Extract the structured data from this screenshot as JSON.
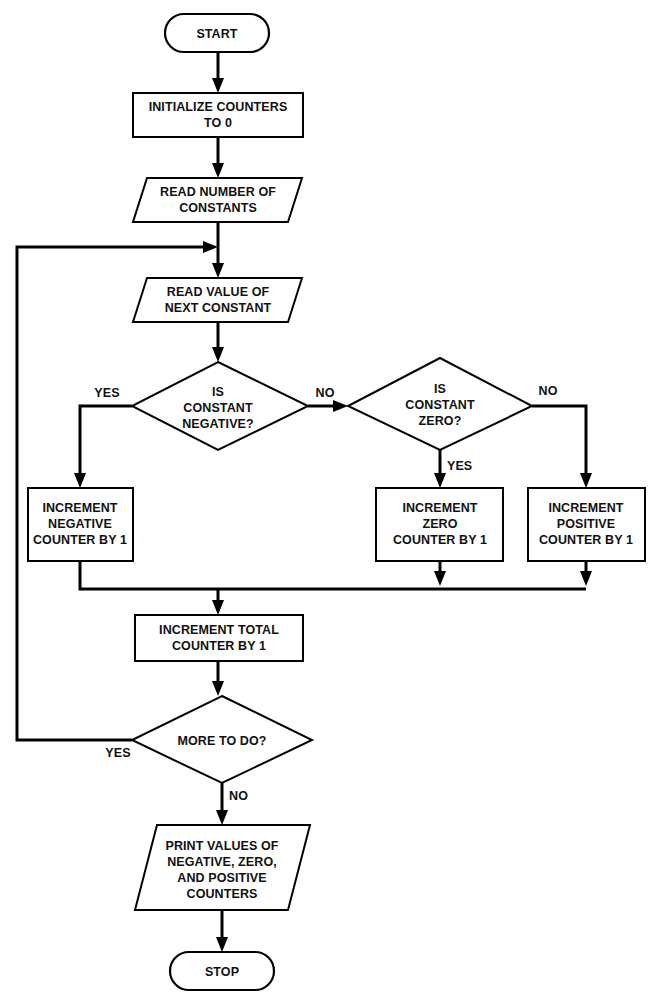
{
  "diagram": {
    "type": "flowchart",
    "orientation": "top-to-bottom",
    "background_color": "#ffffff",
    "line_color": "#000000",
    "text_color": "#111111"
  },
  "nodes": {
    "start": {
      "shape": "terminator",
      "lines": [
        "START"
      ],
      "line1": "START"
    },
    "initialize": {
      "shape": "process",
      "lines": [
        "INITIALIZE COUNTERS",
        "TO 0"
      ],
      "line1": "INITIALIZE COUNTERS",
      "line2": "TO 0"
    },
    "read_number": {
      "shape": "input-output",
      "lines": [
        "READ NUMBER OF",
        "CONSTANTS"
      ],
      "line1": "READ NUMBER OF",
      "line2": "CONSTANTS"
    },
    "read_value": {
      "shape": "input-output",
      "lines": [
        "READ VALUE OF",
        "NEXT CONSTANT"
      ],
      "line1": "READ VALUE OF",
      "line2": "NEXT CONSTANT"
    },
    "is_negative": {
      "shape": "decision",
      "lines": [
        "IS",
        "CONSTANT",
        "NEGATIVE?"
      ],
      "line1": "IS",
      "line2": "CONSTANT",
      "line3": "NEGATIVE?"
    },
    "is_zero": {
      "shape": "decision",
      "lines": [
        "IS",
        "CONSTANT",
        "ZERO?"
      ],
      "line1": "IS",
      "line2": "CONSTANT",
      "line3": "ZERO?"
    },
    "increment_negative": {
      "shape": "process",
      "lines": [
        "INCREMENT",
        "NEGATIVE",
        "COUNTER BY 1"
      ],
      "line1": "INCREMENT",
      "line2": "NEGATIVE",
      "line3": "COUNTER BY 1"
    },
    "increment_zero": {
      "shape": "process",
      "lines": [
        "INCREMENT",
        "ZERO",
        "COUNTER BY 1"
      ],
      "line1": "INCREMENT",
      "line2": "ZERO",
      "line3": "COUNTER BY 1"
    },
    "increment_positive": {
      "shape": "process",
      "lines": [
        "INCREMENT",
        "POSITIVE",
        "COUNTER BY 1"
      ],
      "line1": "INCREMENT",
      "line2": "POSITIVE",
      "line3": "COUNTER BY 1"
    },
    "increment_total": {
      "shape": "process",
      "lines": [
        "INCREMENT TOTAL",
        "COUNTER BY 1"
      ],
      "line1": "INCREMENT TOTAL",
      "line2": "COUNTER BY 1"
    },
    "more_to_do": {
      "shape": "decision",
      "lines": [
        "MORE TO DO?"
      ],
      "line1": "MORE TO DO?"
    },
    "print_values": {
      "shape": "input-output",
      "lines": [
        "PRINT VALUES OF",
        "NEGATIVE, ZERO,",
        "AND POSITIVE",
        "COUNTERS"
      ],
      "line1": "PRINT VALUES OF",
      "line2": "NEGATIVE, ZERO,",
      "line3": "AND POSITIVE",
      "line4": "COUNTERS"
    },
    "stop": {
      "shape": "terminator",
      "lines": [
        "STOP"
      ],
      "line1": "STOP"
    }
  },
  "edge_labels": {
    "negative_yes": "YES",
    "negative_no": "NO",
    "zero_yes": "YES",
    "zero_no": "NO",
    "more_yes": "YES",
    "more_no": "NO"
  },
  "edges": [
    {
      "from": "start",
      "to": "initialize",
      "label": ""
    },
    {
      "from": "initialize",
      "to": "read_number",
      "label": ""
    },
    {
      "from": "read_number",
      "to": "read_value",
      "label": ""
    },
    {
      "from": "read_value",
      "to": "is_negative",
      "label": ""
    },
    {
      "from": "is_negative",
      "to": "increment_negative",
      "label": "YES"
    },
    {
      "from": "is_negative",
      "to": "is_zero",
      "label": "NO"
    },
    {
      "from": "is_zero",
      "to": "increment_zero",
      "label": "YES"
    },
    {
      "from": "is_zero",
      "to": "increment_positive",
      "label": "NO"
    },
    {
      "from": "increment_negative",
      "to": "increment_total",
      "label": ""
    },
    {
      "from": "increment_zero",
      "to": "increment_total",
      "label": ""
    },
    {
      "from": "increment_positive",
      "to": "increment_total",
      "label": ""
    },
    {
      "from": "increment_total",
      "to": "more_to_do",
      "label": ""
    },
    {
      "from": "more_to_do",
      "to": "read_value",
      "label": "YES"
    },
    {
      "from": "more_to_do",
      "to": "print_values",
      "label": "NO"
    },
    {
      "from": "print_values",
      "to": "stop",
      "label": ""
    }
  ]
}
